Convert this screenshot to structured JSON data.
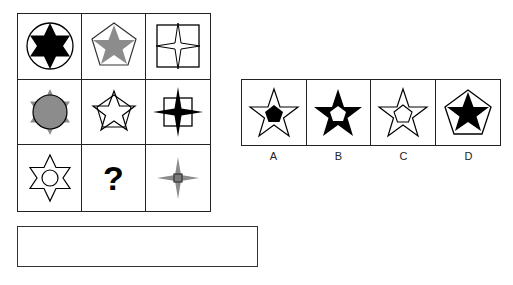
{
  "puzzle": {
    "grid": [
      {
        "row": 1,
        "col": 1,
        "shape": "six-point-star-black-in-circle"
      },
      {
        "row": 1,
        "col": 2,
        "shape": "five-point-star-gray-in-pentagon"
      },
      {
        "row": 1,
        "col": 3,
        "shape": "four-point-star-white-in-square"
      },
      {
        "row": 2,
        "col": 1,
        "shape": "six-point-star-gray-with-circle"
      },
      {
        "row": 2,
        "col": 2,
        "shape": "five-point-star-outline-overlapping-pentagon"
      },
      {
        "row": 2,
        "col": 3,
        "shape": "four-point-star-black-with-square"
      },
      {
        "row": 3,
        "col": 1,
        "shape": "six-point-star-white-with-circle-inside"
      },
      {
        "row": 3,
        "col": 2,
        "shape": "question-mark",
        "text": "?"
      },
      {
        "row": 3,
        "col": 3,
        "shape": "four-point-star-gray-with-small-square"
      }
    ],
    "question_mark": "?"
  },
  "options": [
    {
      "label": "A",
      "shape": "white-star-with-black-pentagon-inside"
    },
    {
      "label": "B",
      "shape": "black-star-with-white-pentagon-inside"
    },
    {
      "label": "C",
      "shape": "white-star-with-white-pentagon-inside"
    },
    {
      "label": "D",
      "shape": "black-star-in-pentagon"
    }
  ],
  "answer_box": {
    "value": ""
  },
  "colors": {
    "black": "#000000",
    "gray": "#8c8c8c",
    "border": "#222222"
  }
}
